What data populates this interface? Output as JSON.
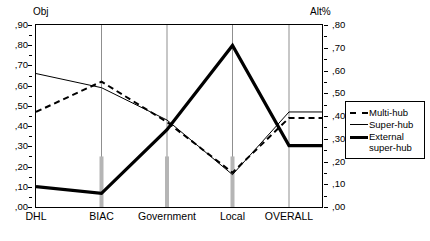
{
  "axes": {
    "left_title": "Obj",
    "right_title": "Alt%",
    "left_ticks": [
      ",90",
      ",80",
      ",70",
      ",60",
      ",50",
      ",40",
      ",30",
      ",20",
      ",10",
      ",00"
    ],
    "right_ticks": [
      ",80",
      ",70",
      ",60",
      ",50",
      ",40",
      ",30",
      ",20",
      ",10",
      ",00"
    ]
  },
  "legend": {
    "items": [
      {
        "label": "Multi-hub",
        "style": "dashed"
      },
      {
        "label": "Super-hub",
        "style": "thin-solid"
      },
      {
        "label": "External\nsuper-hub",
        "style": "thick-solid"
      }
    ]
  },
  "chart_data": {
    "type": "line",
    "title": "",
    "xlabel": "",
    "ylabel": "Obj",
    "y2label": "Alt%",
    "categories": [
      "DHL",
      "BIAC",
      "Government",
      "Local",
      "OVERALL"
    ],
    "ylim": [
      0.0,
      0.9
    ],
    "y2lim": [
      0.0,
      0.8
    ],
    "grid": "vertical-only",
    "legend_position": "right",
    "series": [
      {
        "name": "Multi-hub",
        "axis": "left",
        "style": "dashed",
        "values": [
          0.47,
          0.62,
          0.42,
          0.17,
          0.44
        ]
      },
      {
        "name": "Super-hub",
        "axis": "left",
        "style": "thin-solid",
        "values": [
          0.66,
          0.59,
          0.43,
          0.16,
          0.47
        ]
      },
      {
        "name": "External super-hub",
        "axis": "right",
        "style": "thick-solid",
        "values": [
          0.09,
          0.06,
          0.34,
          0.71,
          0.27
        ]
      }
    ],
    "annotations": [
      {
        "type": "tick-bar",
        "category": "BIAC",
        "top_value": 0.25
      },
      {
        "type": "tick-bar",
        "category": "Government",
        "top_value": 0.25
      },
      {
        "type": "tick-bar",
        "category": "Local",
        "top_value": 0.25
      }
    ]
  }
}
